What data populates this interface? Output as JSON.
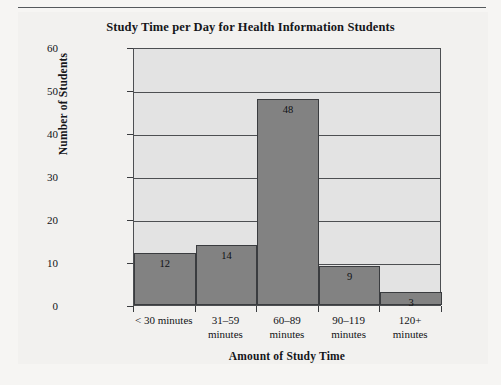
{
  "page": {
    "background_color": "#f6f5f3",
    "panel_color": "#f2f1ef",
    "rule_color": "#55595c"
  },
  "chart_data": {
    "type": "bar",
    "title": "Study Time per Day for Health Information Students",
    "xlabel": "Amount of Study Time",
    "ylabel": "Number of Students",
    "categories": [
      "< 30 minutes",
      "31–59 minutes",
      "60–89 minutes",
      "90–119 minutes",
      "120+ minutes"
    ],
    "category_lines": [
      [
        "< 30 minutes"
      ],
      [
        "31–59",
        "minutes"
      ],
      [
        "60–89",
        "minutes"
      ],
      [
        "90–119",
        "minutes"
      ],
      [
        "120+",
        "minutes"
      ]
    ],
    "values": [
      12,
      14,
      48,
      9,
      3
    ],
    "data_labels": [
      "12",
      "14",
      "48",
      "9",
      "3"
    ],
    "ylim": [
      0,
      60
    ],
    "yticks": [
      0,
      10,
      20,
      30,
      40,
      50,
      60
    ],
    "ytick_labels": [
      "0",
      "10",
      "20",
      "30",
      "40",
      "50",
      "60"
    ],
    "grid": true,
    "legend": null,
    "bar_gap": 0,
    "colors": {
      "bar_fill": "#828282",
      "bar_edge": "#3a3c3f",
      "plot_background": "#e3e3e3",
      "axis": "#4d4f52",
      "text": "#15161a"
    }
  }
}
